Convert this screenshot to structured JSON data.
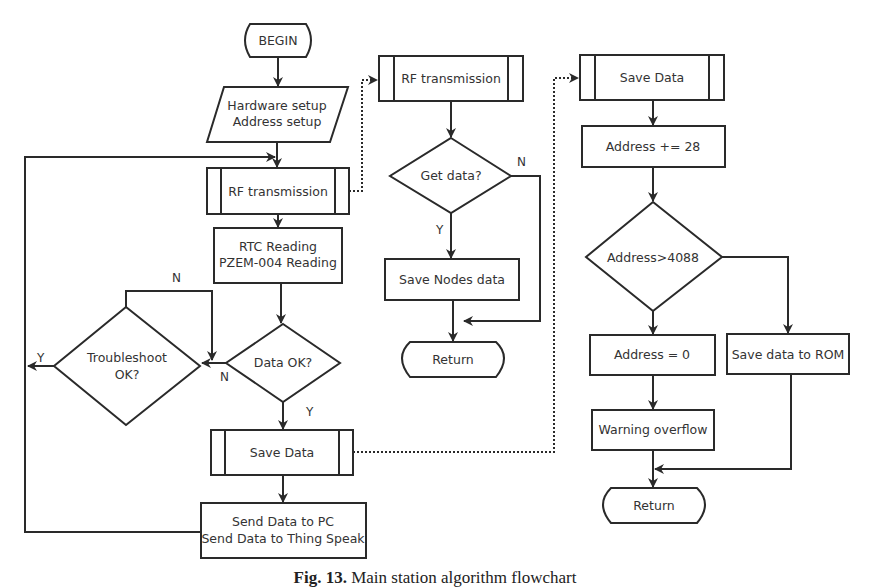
{
  "diagram": {
    "type": "flowchart",
    "caption": {
      "prefix": "Fig. 13.",
      "text": "Main station algorithm flowchart"
    },
    "main_flow": {
      "begin": "BEGIN",
      "setup_line1": "Hardware setup",
      "setup_line2": "Address setup",
      "rf_transmission": "RF transmission",
      "reading_line1": "RTC Reading",
      "reading_line2": "PZEM-004 Reading",
      "data_ok": "Data OK?",
      "data_ok_yes": "Y",
      "data_ok_no": "N",
      "troubleshoot_line1": "Troubleshoot",
      "troubleshoot_line2": "OK?",
      "troubleshoot_yes": "Y",
      "troubleshoot_no": "N",
      "save_data": "Save Data",
      "send_line1": "Send Data to PC",
      "send_line2": "Send Data to Thing Speak"
    },
    "rf_subroutine": {
      "title": "RF transmission",
      "get_data": "Get data?",
      "get_data_yes": "Y",
      "get_data_no": "N",
      "save_nodes": "Save Nodes data",
      "return": "Return"
    },
    "save_subroutine": {
      "title": "Save Data",
      "address_increment": "Address += 28",
      "address_check": "Address>4088",
      "address_reset": "Address = 0",
      "save_rom": "Save data to ROM",
      "warning": "Warning overflow",
      "return": "Return"
    },
    "colors": {
      "stroke": "#2a2a2a",
      "text": "#333333",
      "background": "#ffffff"
    }
  }
}
